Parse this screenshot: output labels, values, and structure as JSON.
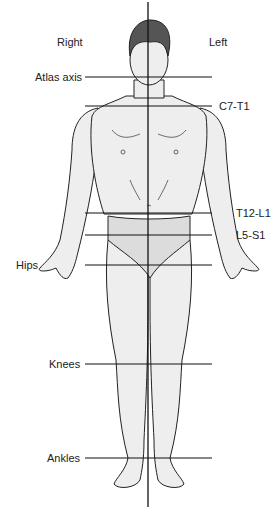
{
  "diagram": {
    "type": "posture-plumb-line-anterior-view",
    "side_labels": {
      "right": "Right",
      "left": "Left"
    },
    "reference_lines": [
      {
        "label": "Atlas axis",
        "side": "left",
        "y": 77
      },
      {
        "label": "C7-T1",
        "side": "right",
        "y": 106
      },
      {
        "label": "T12-L1",
        "side": "right",
        "y": 213
      },
      {
        "label": "L5-S1",
        "side": "right",
        "y": 235
      },
      {
        "label": "Hips",
        "side": "left",
        "y": 265
      },
      {
        "label": "Knees",
        "side": "left",
        "y": 364
      },
      {
        "label": "Ankles",
        "side": "left",
        "y": 458
      }
    ],
    "colors": {
      "line": "#111111",
      "skin": "#eeeeee",
      "hair": "#555555",
      "briefs": "#dcdcdc"
    }
  }
}
